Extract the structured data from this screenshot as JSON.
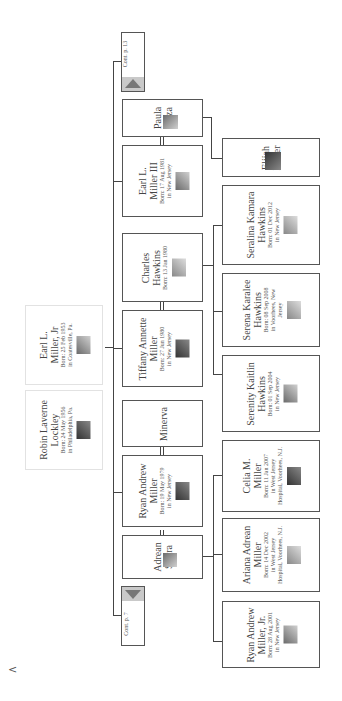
{
  "continuation": {
    "top": {
      "label": "Cont. p. 13"
    },
    "bottom": {
      "label": "Cont. p. 7"
    }
  },
  "parents": [
    {
      "name_line1": "Earl L.",
      "name_line2": "Miller, Jr",
      "born": "Born: 25 Feb 1953",
      "place": "in Coatesville, Pa.",
      "photo": "portrait-photo"
    },
    {
      "name_line1": "Robin Laverne",
      "name_line2": "Lockley",
      "born": "Born: 24 May 1956",
      "place": "in Philadelphia, Pa.",
      "photo": "portrait-photo"
    }
  ],
  "children": [
    {
      "name_line1": "Paula",
      "name_line2": "Plaza",
      "born": "",
      "place": "",
      "role": "spouse"
    },
    {
      "name_line1": "Earl L.",
      "name_line2": "Miller III",
      "born": "Born: 17 Aug 1981",
      "place": "in New Jersey",
      "role": "child"
    },
    {
      "name_line1": "Charles",
      "name_line2": "Hawkins",
      "born": "Born: 13 Jan 1980",
      "place": "",
      "role": "spouse"
    },
    {
      "name_line1": "Tiffany Annette",
      "name_line2": "Miller",
      "born": "Born: 27 Jun 1980",
      "place": "in New Jersey",
      "role": "child"
    },
    {
      "name_line1": "Minerva",
      "name_line2": "",
      "born": "",
      "place": "",
      "role": "spouse"
    },
    {
      "name_line1": "Ryan Andrew",
      "name_line2": "Miller",
      "born": "Born: 19 May 1979",
      "place": "in New Jersey",
      "role": "child"
    },
    {
      "name_line1": "Adrean",
      "name_line2": "Sierra",
      "born": "",
      "place": "",
      "role": "spouse"
    }
  ],
  "grandchildren": [
    {
      "name_line1": "Elijah",
      "name_line2": "Miller",
      "born": "",
      "place": "",
      "place2": ""
    },
    {
      "name_line1": "Seralina Kamara",
      "name_line2": "Hawkins",
      "born": "Born: 01 Dec 2012",
      "place": "in New Jersey",
      "place2": ""
    },
    {
      "name_line1": "Serena Karalee",
      "name_line2": "Hawkins",
      "born": "Born: 08 Sep 2008",
      "place": "in Voorhees, New",
      "place2": "Jersey"
    },
    {
      "name_line1": "Serenity Kaitlin",
      "name_line2": "Hawkins",
      "born": "Born: 01 Sep 2004",
      "place": "in New Jersey",
      "place2": ""
    },
    {
      "name_line1": "Celia M.",
      "name_line2": "Miller",
      "born": "Born: 11 Jan 2007",
      "place": "in West Jersey",
      "place2": "Hospital, Voorhees, N.J."
    },
    {
      "name_line1": "Ariana Adrean",
      "name_line2": "Miller",
      "born": "Born: 14 Dec 2002",
      "place": "in West Jersey",
      "place2": "Hospital, Voorhees, N.J."
    },
    {
      "name_line1": "Ryan Andrew",
      "name_line2": "Miller, Jr.",
      "born": "Born: 28 Aug 2001",
      "place": "in New Jersey",
      "place2": ""
    }
  ],
  "nav": {
    "back_glyph": "<"
  }
}
